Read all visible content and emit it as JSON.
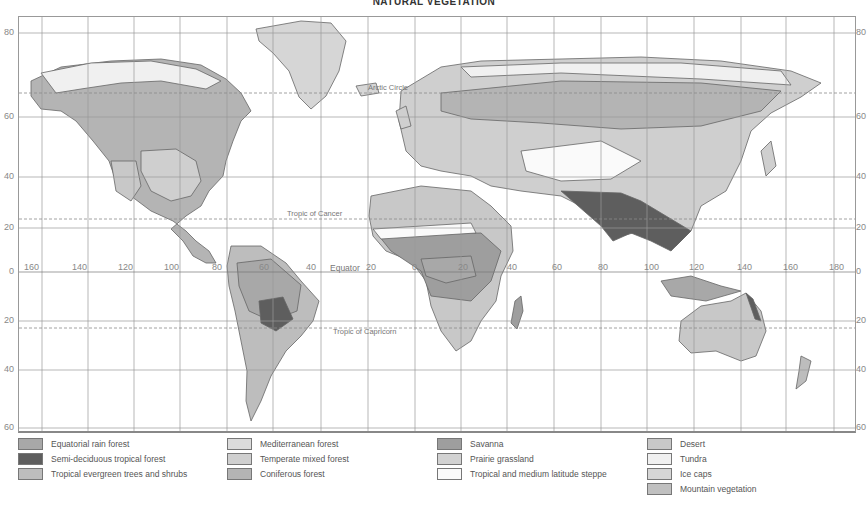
{
  "title": "NATURAL VEGETATION",
  "map": {
    "latitude_labels_left": [
      {
        "text": "80",
        "y": 32
      },
      {
        "text": "60",
        "y": 116
      },
      {
        "text": "40",
        "y": 176
      },
      {
        "text": "20",
        "y": 227
      },
      {
        "text": "0",
        "y": 271
      },
      {
        "text": "20",
        "y": 320
      },
      {
        "text": "40",
        "y": 369
      },
      {
        "text": "60",
        "y": 427
      }
    ],
    "latitude_labels_right": [
      {
        "text": "80",
        "y": 32
      },
      {
        "text": "60",
        "y": 116
      },
      {
        "text": "40",
        "y": 176
      },
      {
        "text": "20",
        "y": 227
      },
      {
        "text": "0",
        "y": 271
      },
      {
        "text": "20",
        "y": 320
      },
      {
        "text": "40",
        "y": 369
      },
      {
        "text": "60",
        "y": 427
      }
    ],
    "longitude_labels": [
      {
        "text": "160",
        "x": 24
      },
      {
        "text": "140",
        "x": 72
      },
      {
        "text": "120",
        "x": 118
      },
      {
        "text": "100",
        "x": 164
      },
      {
        "text": "80",
        "x": 212
      },
      {
        "text": "60",
        "x": 259
      },
      {
        "text": "40",
        "x": 306
      },
      {
        "text": "20",
        "x": 366
      },
      {
        "text": "0",
        "x": 412
      },
      {
        "text": "20",
        "x": 458
      },
      {
        "text": "40",
        "x": 507
      },
      {
        "text": "60",
        "x": 552
      },
      {
        "text": "80",
        "x": 598
      },
      {
        "text": "100",
        "x": 644
      },
      {
        "text": "120",
        "x": 689
      },
      {
        "text": "140",
        "x": 737
      },
      {
        "text": "160",
        "x": 783
      },
      {
        "text": "180",
        "x": 829
      }
    ],
    "reference_lines": {
      "arctic_circle": "Arctic Circle",
      "tropic_of_cancer": "Tropic of Cancer",
      "equator": "Equator",
      "tropic_of_capricorn": "Tropic of Capricorn"
    }
  },
  "legend": {
    "items": [
      {
        "label": "Equatorial rain forest",
        "color": "#a8a8a8"
      },
      {
        "label": "Semi-deciduous tropical forest",
        "color": "#5e5e5e"
      },
      {
        "label": "Tropical evergreen trees and shrubs",
        "color": "#bdbdbd"
      },
      {
        "label": "Mediterranean forest",
        "color": "#dcdcdc"
      },
      {
        "label": "Temperate mixed forest",
        "color": "#cfcfcf"
      },
      {
        "label": "Coniferous forest",
        "color": "#b4b4b4"
      },
      {
        "label": "Savanna",
        "color": "#9e9e9e"
      },
      {
        "label": "Prairie grassland",
        "color": "#d2d2d2"
      },
      {
        "label": "Tropical and medium latitude steppe",
        "color": "#fafafa"
      },
      {
        "label": "Desert",
        "color": "#c8c8c8"
      },
      {
        "label": "Tundra",
        "color": "#f0f0f0"
      },
      {
        "label": "Ice caps",
        "color": "#d6d6d6"
      },
      {
        "label": "Mountain vegetation",
        "color": "#c0c0c0"
      }
    ]
  },
  "colors": {
    "grid": "#9a9a9a",
    "coast": "#666666",
    "dashed_line": "#8a8a8a"
  }
}
